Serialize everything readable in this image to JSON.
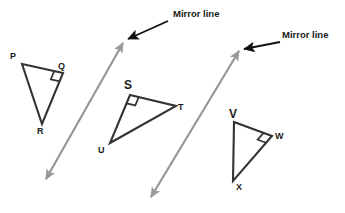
{
  "figure": {
    "background_color": "#ffffff",
    "width": 345,
    "height": 213,
    "colors": {
      "shape_stroke": "#333333",
      "mirror_line": "#999999",
      "pointer_arrow": "#111111",
      "label_text": "#1a1a1a"
    },
    "triangles": [
      {
        "id": "pqr",
        "name": "triangle-pqr",
        "vertices": [
          {
            "label": "P",
            "x": 22,
            "y": 64,
            "label_x": 10,
            "label_y": 52,
            "emphasis": "normal"
          },
          {
            "label": "Q",
            "x": 63,
            "y": 73,
            "label_x": 58,
            "label_y": 62,
            "emphasis": "normal"
          },
          {
            "label": "R",
            "x": 42,
            "y": 124,
            "label_x": 37,
            "label_y": 127,
            "emphasis": "normal"
          }
        ],
        "right_angle_at": "Q"
      },
      {
        "id": "stu",
        "name": "triangle-stu",
        "vertices": [
          {
            "label": "S",
            "x": 130,
            "y": 95,
            "label_x": 124,
            "label_y": 79,
            "emphasis": "bold-large"
          },
          {
            "label": "T",
            "x": 176,
            "y": 106,
            "label_x": 178,
            "label_y": 103,
            "emphasis": "normal"
          },
          {
            "label": "U",
            "x": 110,
            "y": 143,
            "label_x": 98,
            "label_y": 146,
            "emphasis": "normal"
          }
        ],
        "right_angle_at": "S"
      },
      {
        "id": "vwx",
        "name": "triangle-vwx",
        "vertices": [
          {
            "label": "V",
            "x": 234,
            "y": 122,
            "label_x": 229,
            "label_y": 108,
            "emphasis": "bold-large"
          },
          {
            "label": "W",
            "x": 272,
            "y": 136,
            "label_x": 275,
            "label_y": 132,
            "emphasis": "normal"
          },
          {
            "label": "X",
            "x": 233,
            "y": 181,
            "label_x": 236,
            "label_y": 183,
            "emphasis": "normal"
          }
        ],
        "right_angle_at": "W"
      }
    ],
    "mirror_lines": [
      {
        "id": "mirror-1",
        "name": "mirror-line-1",
        "x1": 123,
        "y1": 43,
        "x2": 46,
        "y2": 179,
        "double_headed": true
      },
      {
        "id": "mirror-2",
        "name": "mirror-line-2",
        "x1": 239,
        "y1": 51,
        "x2": 151,
        "y2": 197,
        "double_headed": true
      }
    ],
    "annotations": [
      {
        "id": "annot-1",
        "name": "mirror-line-label-1",
        "text": "Mirror line",
        "text_x": 173,
        "text_y": 9,
        "pointer": {
          "x1": 168,
          "y1": 21,
          "x2": 128,
          "y2": 39
        }
      },
      {
        "id": "annot-2",
        "name": "mirror-line-label-2",
        "text": "Mirror line",
        "text_x": 282,
        "text_y": 30,
        "pointer": {
          "x1": 280,
          "y1": 42,
          "x2": 244,
          "y2": 49
        }
      }
    ]
  }
}
